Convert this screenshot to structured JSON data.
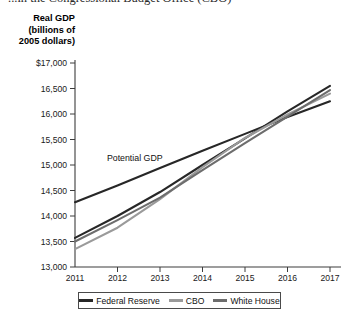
{
  "caption": "...in the Congressional Budget Office (CBO)",
  "axis_title": {
    "line1": "Real GDP",
    "line2": "(billions of",
    "line3": "2005 dollars)"
  },
  "colors": {
    "federal_reserve": "#272727",
    "cbo": "#9a9a9a",
    "white_house": "#6d6d6d",
    "potential_gdp": "#272727",
    "axis": "#3c3c3c",
    "legend_border": "#4a4a4a"
  },
  "legend": {
    "items": [
      {
        "label": "Federal Reserve",
        "color": "#272727"
      },
      {
        "label": "CBO",
        "color": "#9a9a9a"
      },
      {
        "label": "White House",
        "color": "#6d6d6d"
      }
    ]
  },
  "chart_data": {
    "type": "line",
    "title": "",
    "xlabel": "",
    "ylabel": "Real GDP (billions of 2005 dollars)",
    "x": [
      2011,
      2012,
      2013,
      2014,
      2015,
      2016,
      2017
    ],
    "xlim": [
      2011,
      2017
    ],
    "ylim": [
      13000,
      17000
    ],
    "ytick_labels": [
      "$17,000",
      "16,500",
      "16,000",
      "15,500",
      "15,000",
      "14,500",
      "14,000",
      "13,500",
      "13,000"
    ],
    "ytick_values": [
      17000,
      16500,
      16000,
      15500,
      15000,
      14500,
      14000,
      13500,
      13000
    ],
    "xtick_labels": [
      "2011",
      "2012",
      "2013",
      "2014",
      "2015",
      "2016",
      "2017"
    ],
    "grid": false,
    "legend_position": "bottom",
    "annotations": [
      {
        "text": "Potential GDP",
        "x": 2011.75,
        "y": 15080
      }
    ],
    "series": [
      {
        "name": "Potential GDP",
        "color": "#272727",
        "in_legend": false,
        "values": [
          14270,
          14600,
          14940,
          15280,
          15610,
          15940,
          16250
        ]
      },
      {
        "name": "Federal Reserve",
        "color": "#272727",
        "in_legend": true,
        "values": [
          13570,
          14000,
          14470,
          15000,
          15520,
          16050,
          16550
        ]
      },
      {
        "name": "CBO",
        "color": "#9a9a9a",
        "in_legend": true,
        "values": [
          13350,
          13770,
          14330,
          14960,
          15530,
          15990,
          16400
        ]
      },
      {
        "name": "White House",
        "color": "#6d6d6d",
        "in_legend": true,
        "values": [
          13500,
          13920,
          14360,
          14900,
          15430,
          15950,
          16470
        ]
      }
    ]
  }
}
